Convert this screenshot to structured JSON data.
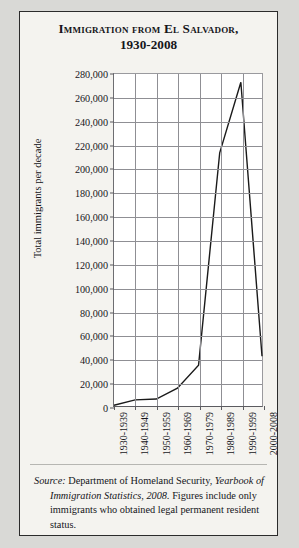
{
  "figure": {
    "title_line1": "Immigration from El Salvador,",
    "title_line2": "1930-2008"
  },
  "source_note": {
    "label": "Source:",
    "text_part1": " Department of Homeland Security, ",
    "publication": "Yearbook of Immigration Statistics, 2008.",
    "text_part2": " Figures include only immigrants who obtained legal permanent resident status."
  },
  "chart_data": {
    "type": "line",
    "title": "Immigration from El Salvador, 1930-2008",
    "xlabel": "",
    "ylabel": "Total immigrants per decade",
    "categories": [
      "1930-1939",
      "1940-1949",
      "1950-1959",
      "1960-1969",
      "1970-1979",
      "1980-1989",
      "1990-1999",
      "2000-2008"
    ],
    "values": [
      673,
      5132,
      5895,
      14992,
      34436,
      213539,
      273017,
      41983
    ],
    "ylim": [
      0,
      280000
    ],
    "ytick_labels": [
      "280,000",
      "260,000",
      "240,000",
      "220,000",
      "200,000",
      "180,000",
      "160,000",
      "140,000",
      "120,000",
      "100,000",
      "80,000",
      "60,000",
      "40,000",
      "20,000",
      "0"
    ],
    "ytick_values": [
      280000,
      260000,
      240000,
      220000,
      200000,
      180000,
      160000,
      140000,
      120000,
      100000,
      80000,
      60000,
      40000,
      20000,
      0
    ],
    "grid": true,
    "legend": false,
    "line_color": "#1a1a1a"
  }
}
